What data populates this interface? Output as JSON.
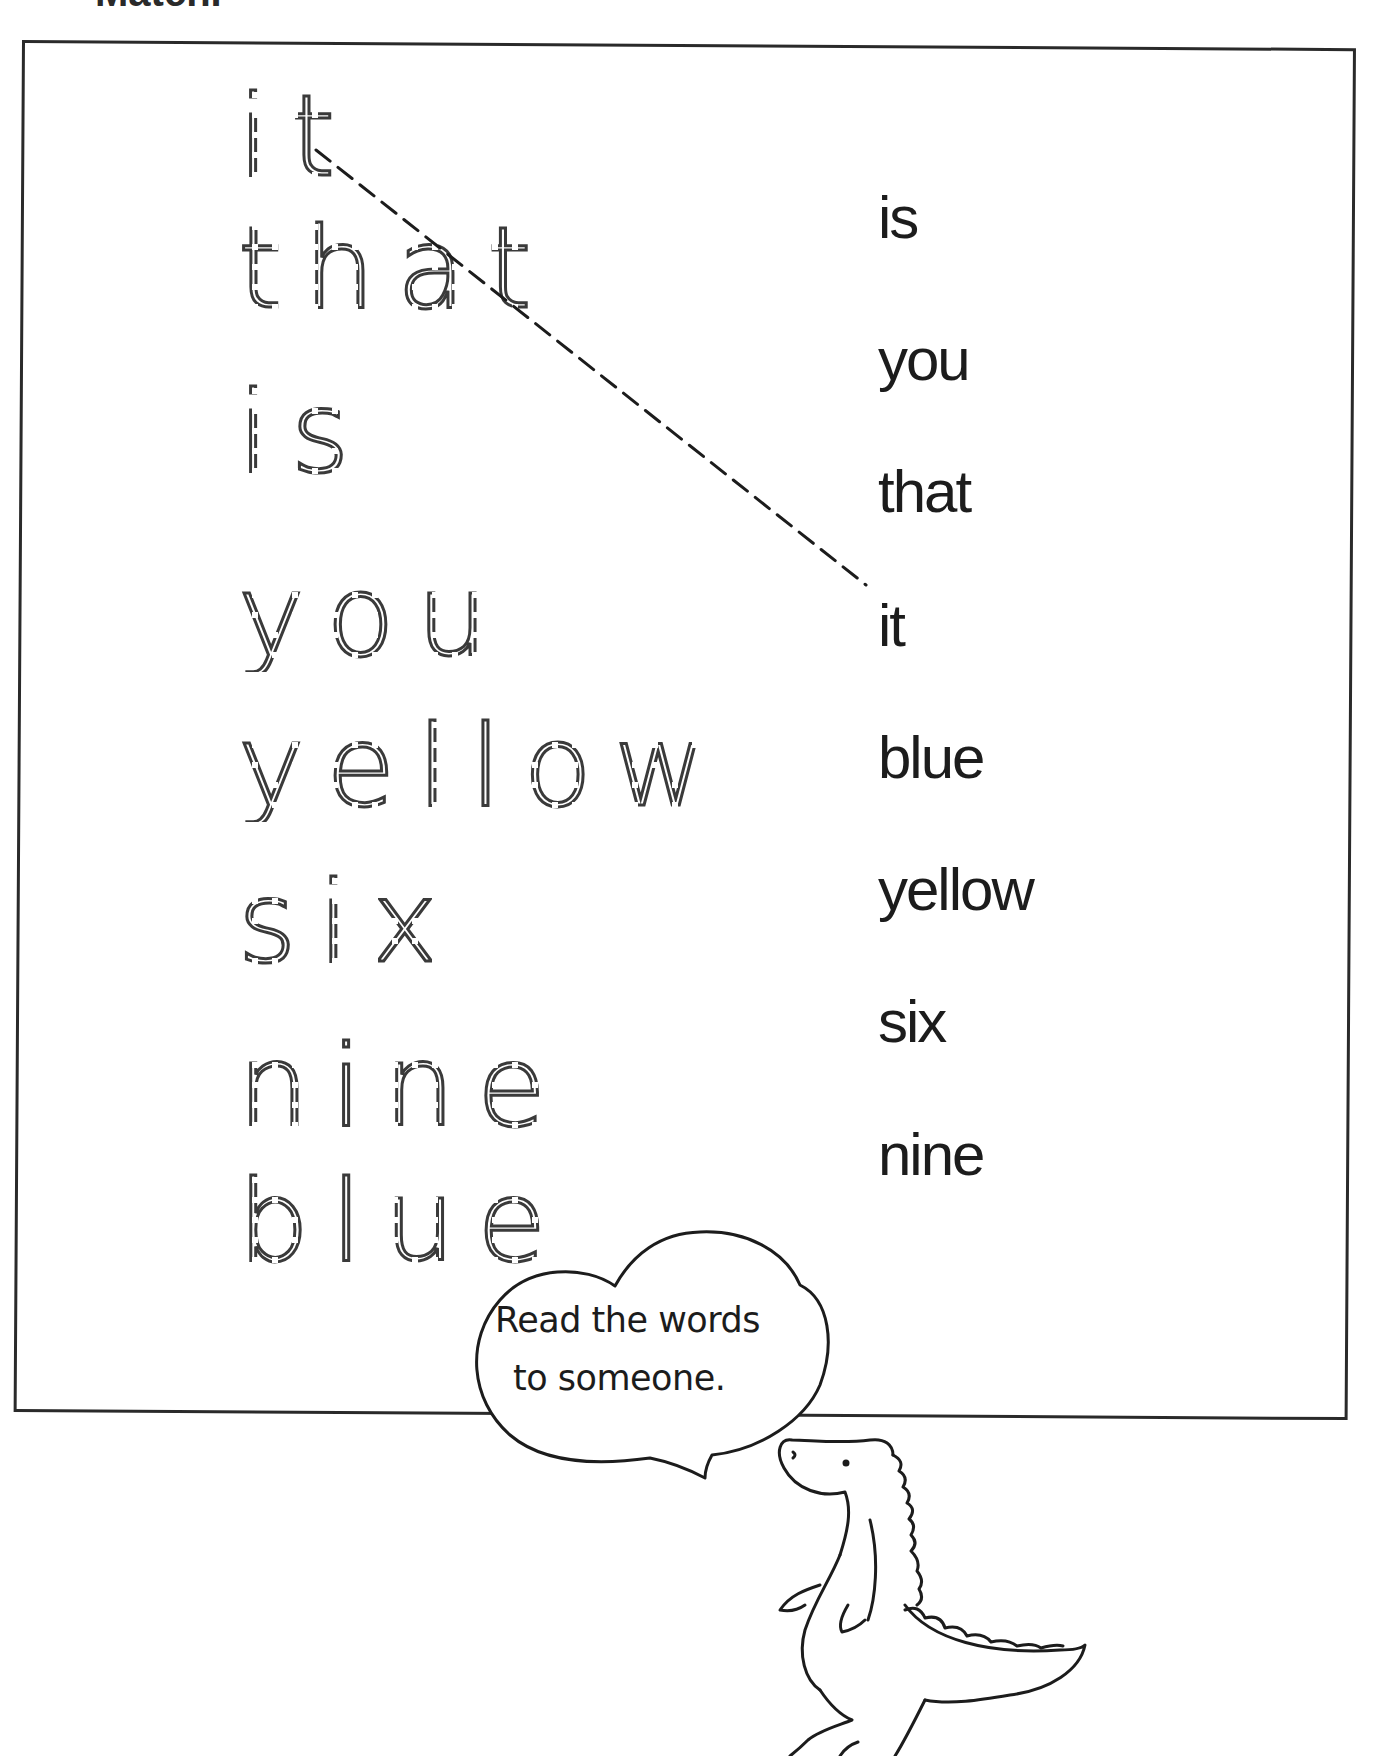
{
  "page": {
    "title": "Match."
  },
  "left_column": {
    "label": "Trace words",
    "words": [
      "it",
      "that",
      "is",
      "you",
      "yellow",
      "six",
      "nine",
      "blue"
    ]
  },
  "right_column": {
    "label": "Match words",
    "words": [
      "is",
      "you",
      "that",
      "it",
      "blue",
      "yellow",
      "six",
      "nine"
    ]
  },
  "example_match": {
    "from": "it",
    "to": "it"
  },
  "speech_bubble": {
    "line1": "Read the words",
    "line2": "to someone."
  },
  "illustration": {
    "icon": "crocodile-icon"
  },
  "colors": {
    "ink": "#1c1c1c",
    "paper": "#ffffff"
  }
}
